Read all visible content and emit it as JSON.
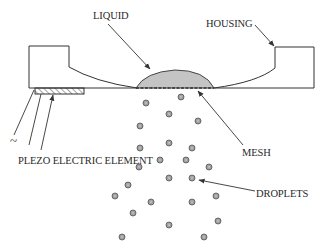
{
  "diagram": {
    "labels": {
      "liquid": "LIQUID",
      "housing": "HOUSING",
      "mesh": "MESH",
      "piezo": "PLEZO ELECTRIC ELEMENT",
      "droplets": "DROPLETS",
      "ac_source": "~"
    },
    "components": [
      {
        "id": "housing",
        "label": "HOUSING",
        "fill": "hatched"
      },
      {
        "id": "liquid",
        "label": "LIQUID",
        "fill": "#c4c4c4"
      },
      {
        "id": "mesh",
        "label": "MESH",
        "style": "dashed"
      },
      {
        "id": "piezo",
        "label": "PLEZO ELECTRIC ELEMENT",
        "fill": "hatched"
      },
      {
        "id": "droplets",
        "label": "DROPLETS",
        "count": 24
      }
    ],
    "colors": {
      "liquid": "#c4c4c4",
      "droplet": "#9a9a9a",
      "line": "#333333"
    }
  }
}
